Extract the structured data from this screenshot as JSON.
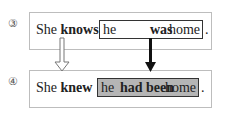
{
  "rows": [
    {
      "number": "③",
      "subject": "She",
      "verb": "knows",
      "clause": {
        "he": "he",
        "verb": "was",
        "home": "home"
      },
      "period": "."
    },
    {
      "number": "④",
      "subject": "She",
      "verb": "knew",
      "clause": {
        "he": "he",
        "verb": "had been",
        "home": "home"
      },
      "period": "."
    }
  ],
  "colors": {
    "highlight": "#b5b5b5",
    "border": "#333333",
    "frame": "#bdbdbd"
  },
  "arrows": [
    {
      "from": "knows",
      "to": "knew",
      "style": "hollow"
    },
    {
      "from": "was",
      "to": "had been",
      "style": "solid"
    }
  ]
}
